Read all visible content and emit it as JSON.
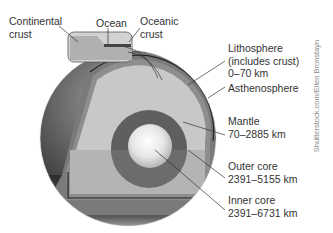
{
  "diagram": {
    "inset_labels": {
      "continental_crust": [
        "Continental",
        "crust"
      ],
      "ocean": "Ocean",
      "oceanic_crust": [
        "Oceanic",
        "crust"
      ]
    },
    "layers": [
      {
        "name": "Lithosphere",
        "lines": [
          "Lithosphere",
          "(includes crust)",
          "0–70 km"
        ]
      },
      {
        "name": "Asthenosphere",
        "lines": [
          "Asthenosphere"
        ]
      },
      {
        "name": "Mantle",
        "lines": [
          "Mantle",
          "70–2885 km"
        ]
      },
      {
        "name": "Outer core",
        "lines": [
          "Outer core",
          "2391–5155 km"
        ]
      },
      {
        "name": "Inner core",
        "lines": [
          "Inner core",
          "2391–6731 km"
        ]
      }
    ],
    "credit": "Shutterstock.com/Ellen Bronstayn",
    "colors": {
      "surface_dark": "#3a3a3a",
      "lithosphere": "#6e6e6e",
      "asthenosphere": "#8a8a8a",
      "mantle": "#c4c4c4",
      "outer_core": "#5f5f5f",
      "inner_core": "#efefef",
      "line": "#333333"
    }
  }
}
